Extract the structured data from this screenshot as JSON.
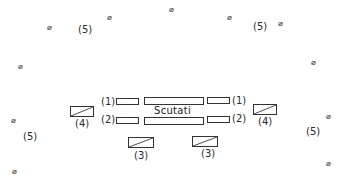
{
  "diagram": {
    "title": "Scutati",
    "labels": {
      "one": "(1)",
      "two": "(2)",
      "three": "(3)",
      "four": "(4)",
      "five": "(5)"
    },
    "marker_symbol": "⌀",
    "marker_name": "circled-slash-marker",
    "groups": [
      {
        "id": "1",
        "label": "(1)",
        "description": "upper flanking rectangles"
      },
      {
        "id": "2",
        "label": "(2)",
        "description": "lower flanking rectangles"
      },
      {
        "id": "3",
        "label": "(3)",
        "description": "rear hatched blocks"
      },
      {
        "id": "4",
        "label": "(4)",
        "description": "side hatched blocks"
      },
      {
        "id": "5",
        "label": "(5)",
        "description": "scattered skirmisher markers"
      }
    ]
  }
}
